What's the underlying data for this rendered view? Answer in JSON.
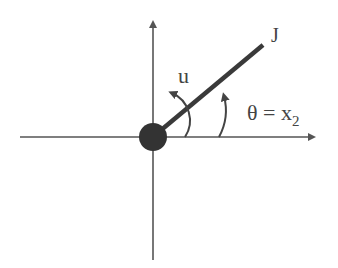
{
  "diagram": {
    "labels": {
      "rod": "J",
      "input": "u",
      "angle": "θ = x",
      "angle_subscript": "2"
    },
    "colors": {
      "axis": "#555555",
      "rod": "#3a3a3a",
      "pivot": "#333333",
      "text": "#444444"
    },
    "rod_angle_deg": 40
  }
}
